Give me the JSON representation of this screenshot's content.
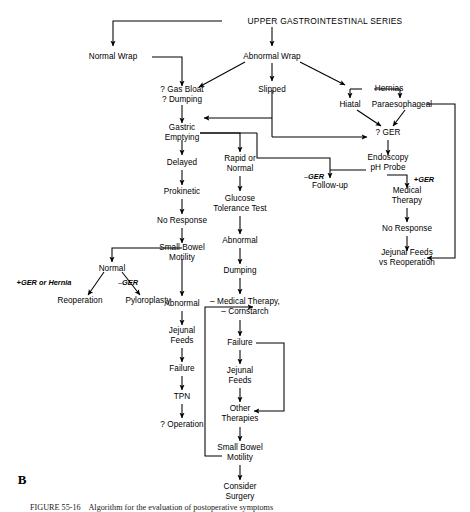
{
  "figure": {
    "panel_letter": "B",
    "caption": "FIGURE 55-16    Algorithm for the evaluation of postoperative symptoms",
    "title": "UPPER GASTROINTESTINAL SERIES"
  },
  "nodes": {
    "ugi_series": "UPPER GASTROINTESTINAL SERIES",
    "normal_wrap": "Normal Wrap",
    "abnormal_wrap": "Abnormal Wrap",
    "gas_bloat": "? Gas Bloat\n? Dumping",
    "slipped": "Slipped",
    "hernias": "Hernias",
    "hiatal": "Hiatal",
    "paraesophageal": "Paraesophageal",
    "gastric_emptying": "Gastric\nEmptying",
    "ger_q": "? GER",
    "delayed": "Delayed",
    "rapid_or_normal": "Rapid or\nNormal",
    "endoscopy_ph": "Endoscopy\npH Probe",
    "prokinetic": "Prokinetic",
    "follow_up": "Follow-up",
    "medical_therapy": "Medical\nTherapy",
    "no_response_1": "No Response",
    "glucose_tolerance": "Glucose\nTolerance Test",
    "no_response_2": "No Response",
    "small_bowel_motility_1": "Small Bowel\nMotility",
    "abnormal_1": "Abnormal",
    "jejunal_vs_reop": "Jejunal Feeds\nvs Reoperation",
    "normal": "Normal",
    "dumping": "Dumping",
    "abnormal_2": "Abnormal",
    "reoperation": "Reoperation",
    "pyloroplasty": "Pyloroplasty",
    "medical_cornstarch": "– Medical Therapy,\n– Cornstarch",
    "jejunal_feeds_1": "Jejunal\nFeeds",
    "failure_1": "Failure",
    "failure_2": "Failure",
    "tpn": "TPN",
    "jejunal_feeds_2": "Jejunal\nFeeds",
    "operation_q": "? Operation",
    "other_therapies": "Other\nTherapies",
    "small_bowel_motility_2": "Small Bowel\nMotility",
    "consider_surgery": "Consider\nSurgery"
  },
  "edge_labels": {
    "minus_ger_1": "–GER",
    "plus_ger": "+GER",
    "plus_ger_or_hernia": "+GER or Hernia",
    "minus_ger_2": "–GER"
  },
  "colors": {
    "line": "#000000",
    "text": "#000000",
    "background": "#ffffff"
  }
}
